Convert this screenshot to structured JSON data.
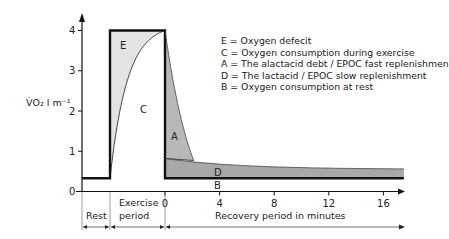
{
  "chart_data": {
    "type": "area",
    "title": "",
    "ylabel": "V̇O₂ l m⁻¹",
    "xlabel": "Recovery period in minutes",
    "ylim": [
      0,
      4
    ],
    "yticks": [
      "0",
      "1",
      "2",
      "3",
      "4"
    ],
    "xticks": [
      "0",
      "4",
      "8",
      "12",
      "16"
    ],
    "recovery_xlim": [
      0,
      17.5
    ],
    "phases": [
      {
        "key": "rest",
        "label": "Rest"
      },
      {
        "key": "exercise",
        "label_line1": "Exercise",
        "label_line2": "period"
      },
      {
        "key": "recovery",
        "label": "Recovery period in minutes"
      }
    ],
    "levels": {
      "resting_vo2": 0.33,
      "exercise_demand": 4.0,
      "slow_component_start": 0.82,
      "fast_component_end_minute": 2.1,
      "fast_component_end_vo2": 0.77,
      "slow_component_end": 0.55
    },
    "regions": [
      {
        "key": "E",
        "label": "E",
        "description": "Oxygen defecit",
        "color": "#e3e3e3"
      },
      {
        "key": "C",
        "label": "C",
        "description": "Oxygen consumption during exercise",
        "color": "#ffffff"
      },
      {
        "key": "A",
        "label": "A",
        "description": "The alactacid debt / EPOC fast replenishment",
        "color": "#b8b8b8"
      },
      {
        "key": "D",
        "label": "D",
        "description": "The lactacid / EPOC slow replenishment",
        "color": "#a8a8a8"
      },
      {
        "key": "B",
        "label": "B",
        "description": "Oxygen consumption at rest",
        "color": "#ffffff"
      }
    ],
    "legend": [
      {
        "key": "E",
        "text": "E  =  Oxygen defecit"
      },
      {
        "key": "C",
        "text": "C = Oxygen consumption during exercise"
      },
      {
        "key": "A",
        "text": "A = The alactacid debt / EPOC fast replenishmen"
      },
      {
        "key": "D",
        "text": "D = The lactacid / EPOC slow replenishment"
      },
      {
        "key": "B",
        "text": "B = Oxygen consumption at rest"
      }
    ],
    "legend_placement": "top-right",
    "grid": false
  }
}
